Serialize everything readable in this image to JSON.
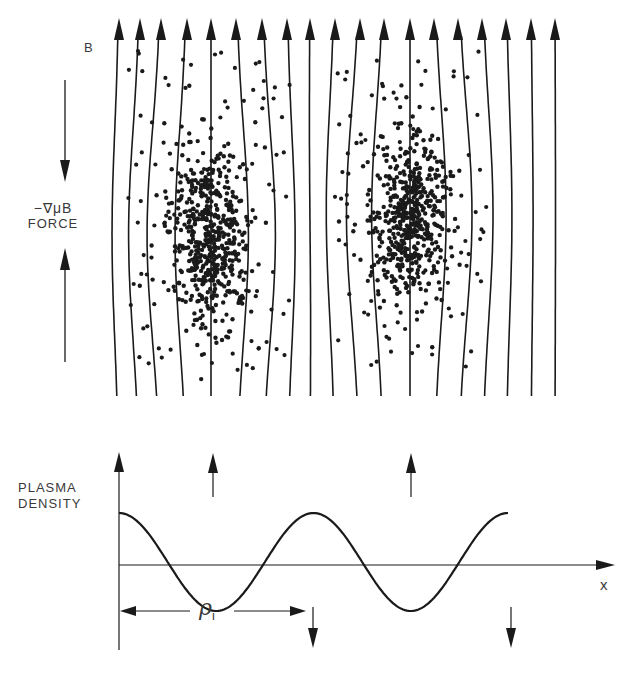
{
  "figure": {
    "colors": {
      "ink": "#1a1a1a",
      "background": "#ffffff",
      "label": "#3a3a3a"
    }
  },
  "top_panel": {
    "field_label": "B",
    "force_label_line1": "−∇μB",
    "force_label_line2": "FORCE",
    "field_line_count": 19,
    "field_line_x": [
      119,
      140,
      161,
      187,
      211,
      236,
      262,
      287,
      310,
      335,
      360,
      384,
      410,
      434,
      458,
      482,
      506,
      531,
      555
    ],
    "clusters": [
      {
        "name": "left-plasma-cluster",
        "cx": 210,
        "cy": 235,
        "rx": 48,
        "ry": 80
      },
      {
        "name": "right-plasma-cluster",
        "cx": 410,
        "cy": 215,
        "rx": 45,
        "ry": 75
      }
    ]
  },
  "bottom_panel": {
    "y_axis_label_line1": "PLASMA",
    "y_axis_label_line2": "DENSITY",
    "x_axis_label": "x",
    "wavelength_label": "ρ",
    "wavelength_subscript": "i",
    "up_arrows_x": [
      213,
      411
    ],
    "down_arrows_x": [
      313,
      511
    ]
  },
  "chart_data": {
    "type": "line",
    "title": "",
    "xlabel": "x",
    "ylabel": "PLASMA DENSITY",
    "x": [
      0,
      0.25,
      0.5,
      0.75,
      1.0,
      1.25,
      1.5,
      1.75,
      2.0
    ],
    "values": [
      -1,
      0,
      1,
      0,
      -1,
      0,
      1,
      0,
      -1
    ],
    "annotations": [
      "ρi (spacing from first minimum to second minimum)",
      "up arrows above peaks",
      "down arrows below troughs"
    ],
    "grid": false
  }
}
